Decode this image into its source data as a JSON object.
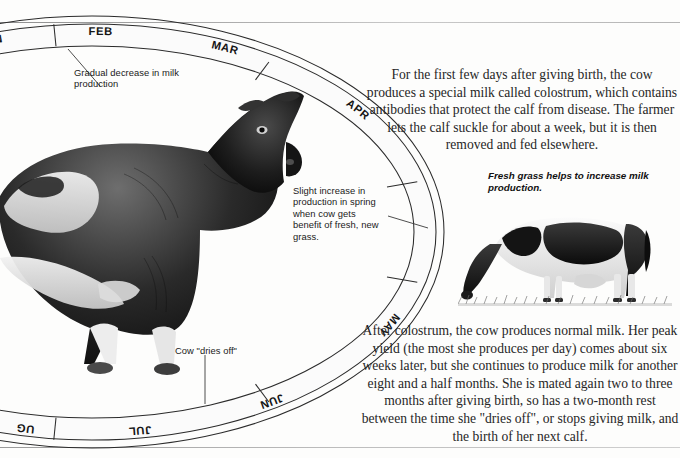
{
  "page": {
    "background_color": "#fdfdfc",
    "ink_color": "#262626"
  },
  "calendar": {
    "name": "annual-milk-production-cycle",
    "shape": "oval-band",
    "months": [
      {
        "label": "JAN",
        "clipped": "AN"
      },
      {
        "label": "FEB",
        "clipped": "FEB"
      },
      {
        "label": "MAR",
        "clipped": "MAR"
      },
      {
        "label": "APR",
        "clipped": "APR"
      },
      {
        "label": "MAY",
        "clipped": "MAY"
      },
      {
        "label": "JUN",
        "clipped": "JUN"
      },
      {
        "label": "JUL",
        "clipped": "JUL"
      },
      {
        "label": "AUG",
        "clipped": "UG"
      }
    ]
  },
  "callouts": {
    "gradual_decrease": "Gradual decrease in milk production",
    "slight_increase": "Slight increase in production in spring when cow gets benefit of fresh, new grass.",
    "dries_off": "Cow \"dries off\""
  },
  "body": {
    "colostrum": "For the first few days after giving birth, the cow produces a special milk called colostrum, which contains antibodies that protect the calf from disease. The farmer lets the calf suckle for about a week, but it is then removed and fed elsewhere.",
    "after_colostrum": "After colostrum, the cow produces normal milk. Her peak yield (the most she produces per day) comes about six weeks later, but she continues to produce milk for another eight and a half months. She is mated again two to three months after giving birth, so has a two-month rest between the time she \"dries off\", or stops giving milk, and the birth of her next calf."
  },
  "captions": {
    "fresh_grass": "Fresh grass helps to increase milk production."
  },
  "figures": {
    "main_cow": "holstein-dairy-cow-standing-profile",
    "grazing_cow": "holstein-cow-grazing-on-grass"
  }
}
